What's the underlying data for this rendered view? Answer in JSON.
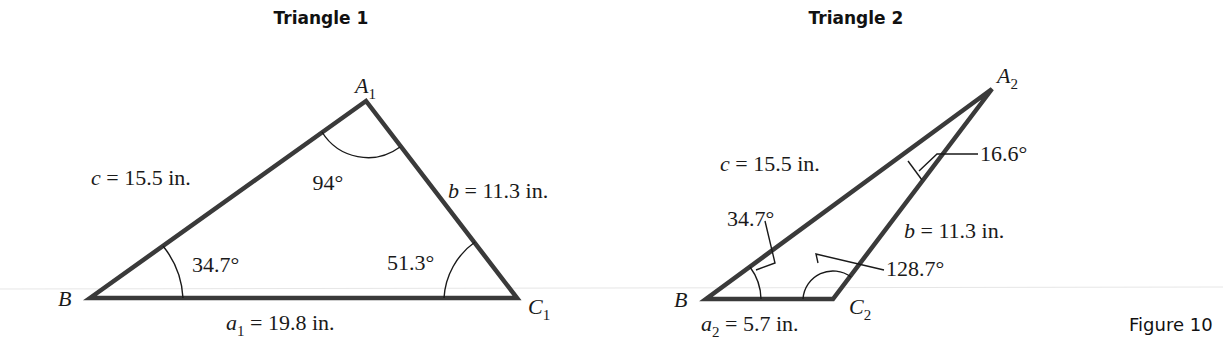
{
  "figure": {
    "label": "Figure 10"
  },
  "triangle1": {
    "title": "Triangle 1",
    "vertices": {
      "A": "A",
      "A_sub": "1",
      "B": "B",
      "C": "C",
      "C_sub": "1"
    },
    "sides": {
      "c": {
        "var": "c",
        "text": " = 15.5 in."
      },
      "b": {
        "var": "b",
        "text": " = 11.3 in."
      },
      "a": {
        "var": "a",
        "sub": "1",
        "text": " = 19.8 in."
      }
    },
    "angles": {
      "A": "94°",
      "B": "34.7°",
      "C": "51.3°"
    }
  },
  "triangle2": {
    "title": "Triangle 2",
    "vertices": {
      "A": "A",
      "A_sub": "2",
      "B": "B",
      "C": "C",
      "C_sub": "2"
    },
    "sides": {
      "c": {
        "var": "c",
        "text": " = 15.5 in."
      },
      "b": {
        "var": "b",
        "text": " = 11.3 in."
      },
      "a": {
        "var": "a",
        "sub": "2",
        "text": " = 5.7 in."
      }
    },
    "angles": {
      "A": "16.6°",
      "B": "34.7°",
      "C": "128.7°"
    }
  }
}
